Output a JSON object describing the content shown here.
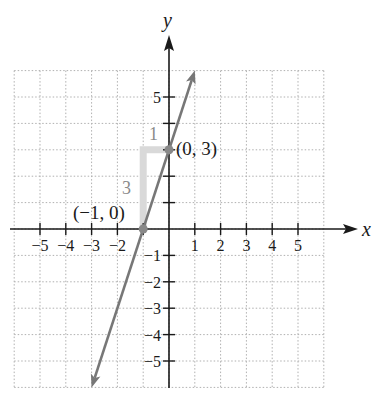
{
  "chart_data": {
    "type": "line",
    "title": "",
    "xlabel": "x",
    "ylabel": "y",
    "xlim": [
      -6,
      6
    ],
    "ylim": [
      -6,
      6
    ],
    "grid": true,
    "grid_style": "dotted",
    "x_ticks": [
      -5,
      -4,
      -3,
      -2,
      -1,
      1,
      2,
      3,
      4,
      5
    ],
    "x_tick_labels": [
      "−5",
      "−4",
      "−3",
      "−2",
      "",
      "1",
      "2",
      "3",
      "4",
      "5"
    ],
    "y_ticks": [
      5,
      4,
      3,
      2,
      1,
      -1,
      -2,
      -3,
      -4,
      -5
    ],
    "y_tick_labels": [
      "5",
      "",
      "",
      "",
      "",
      "−1",
      "−2",
      "−3",
      "−4",
      "−5"
    ],
    "series": [
      {
        "name": "line",
        "equation": "y = 3x + 3",
        "slope": 3,
        "y_intercept": 3,
        "x": [
          -3,
          1
        ],
        "y": [
          -6,
          6
        ],
        "arrows_both_ends": true,
        "color": "#777777"
      }
    ],
    "points": [
      {
        "x": -1,
        "y": 0,
        "label": "(−1, 0)"
      },
      {
        "x": 0,
        "y": 3,
        "label": "(0, 3)"
      }
    ],
    "annotations": [
      {
        "type": "slope-triangle",
        "rise": 3,
        "run": 1,
        "rise_label": "3",
        "run_label": "1",
        "color": "#d8d8d8"
      }
    ]
  },
  "labels": {
    "x_axis": "x",
    "y_axis": "y",
    "point_a": "(−1, 0)",
    "point_b": "(0, 3)",
    "rise": "3",
    "run": "1"
  },
  "colors": {
    "axis": "#1a1a1a",
    "grid": "#b0b0b0",
    "line": "#777777",
    "point": "#888888",
    "triangle": "#d9d9d9",
    "annotation_text": "#8a8a8a"
  }
}
